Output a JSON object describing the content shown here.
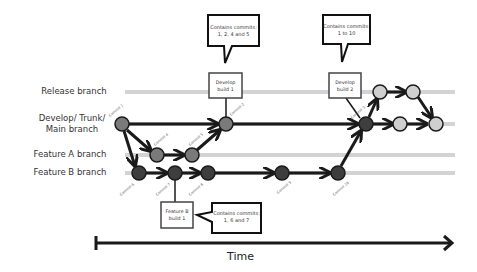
{
  "diagram": {
    "lanes": [
      {
        "id": "release",
        "label": "Release branch",
        "y": 92
      },
      {
        "id": "develop",
        "label": "Develop/ Trunk/ Main branch",
        "label_lines": [
          "Develop/ Trunk/",
          "Main branch"
        ],
        "y": 124
      },
      {
        "id": "featureA",
        "label": "Feature A branch",
        "y": 155
      },
      {
        "id": "featureB",
        "label": "Feature B branch",
        "y": 173
      }
    ],
    "commits": [
      {
        "id": "c1",
        "label": "Commit 1",
        "lane": "develop",
        "x": 122
      },
      {
        "id": "c4",
        "label": "Commit 4",
        "lane": "featureA",
        "x": 157
      },
      {
        "id": "c5",
        "label": "Commit 5",
        "lane": "featureA",
        "x": 192
      },
      {
        "id": "c2",
        "label": "Commit 2",
        "lane": "develop",
        "x": 226
      },
      {
        "id": "c6",
        "label": "Commit 6",
        "lane": "featureB",
        "x": 139
      },
      {
        "id": "c7",
        "label": "Commit 7",
        "lane": "featureB",
        "x": 175
      },
      {
        "id": "c8",
        "label": "Commit 8",
        "lane": "featureB",
        "x": 208
      },
      {
        "id": "c9",
        "label": "Commit 9",
        "lane": "featureB",
        "x": 282
      },
      {
        "id": "c10",
        "label": "Commit 10",
        "lane": "featureB",
        "x": 338
      },
      {
        "id": "c3",
        "label": "Commit 3",
        "lane": "develop",
        "x": 366
      }
    ],
    "builds": [
      {
        "id": "dev1",
        "line1": "Develop",
        "line2": "build 1"
      },
      {
        "id": "dev2",
        "line1": "Develop",
        "line2": "build 2"
      },
      {
        "id": "featB1",
        "line1": "Feature B",
        "line2": "build 1"
      }
    ],
    "callouts": [
      {
        "id": "dev1",
        "line1": "Contains commits:",
        "line2": "1, 2, 4 and 5"
      },
      {
        "id": "dev2",
        "line1": "Contains commits:",
        "line2": "1 to 10"
      },
      {
        "id": "featB1",
        "line1": "Contains commits:",
        "line2": "1, 6 and 7"
      }
    ],
    "time_axis": {
      "label": "Time"
    },
    "colors": {
      "lane": "#d3d3d3",
      "commit_mid": "#7a7a7a",
      "commit_dark": "#3e3e3e",
      "commit_light": "#cfcfcf",
      "stroke": "#1a1a1a"
    }
  }
}
